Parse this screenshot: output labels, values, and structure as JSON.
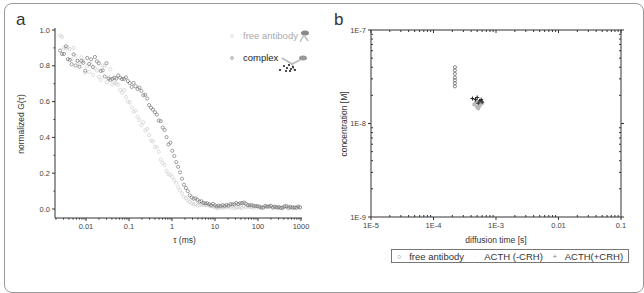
{
  "figure": {
    "panel_a_label": "a",
    "panel_b_label": "b"
  },
  "chart_data": [
    {
      "panel": "a",
      "type": "scatter",
      "title": "",
      "xlabel": "τ (ms)",
      "ylabel": "normalized G(τ)",
      "xscale": "log",
      "xlim": [
        0.002,
        1000
      ],
      "ylim": [
        -0.05,
        1.0
      ],
      "xticks": [
        "0.01",
        "0.1",
        "1",
        "10",
        "100",
        "1000"
      ],
      "yticks": [
        "0.0",
        "0.2",
        "0.4",
        "0.6",
        "0.8",
        "1.0"
      ],
      "legend": [
        "free antibody",
        "complex"
      ],
      "legend_position": "upper right",
      "series": [
        {
          "name": "free antibody",
          "marker": "open circle (light gray)",
          "color": "#c8c8c8",
          "x": [
            0.0025,
            0.004,
            0.006,
            0.01,
            0.02,
            0.04,
            0.07,
            0.1,
            0.2,
            0.3,
            0.5,
            0.7,
            1.0,
            1.5,
            2.0,
            3.0,
            5,
            10,
            30,
            100,
            1000
          ],
          "y": [
            0.97,
            0.9,
            0.84,
            0.8,
            0.77,
            0.73,
            0.66,
            0.6,
            0.48,
            0.41,
            0.31,
            0.24,
            0.18,
            0.11,
            0.06,
            0.03,
            0.02,
            0.01,
            0.01,
            0.01,
            0.01
          ]
        },
        {
          "name": "complex",
          "marker": "open circle (dark gray)",
          "color": "#666666",
          "x": [
            0.0025,
            0.004,
            0.006,
            0.01,
            0.02,
            0.04,
            0.07,
            0.1,
            0.2,
            0.3,
            0.5,
            0.7,
            1.0,
            1.5,
            2.0,
            3.0,
            5,
            10,
            20,
            40,
            100,
            1000
          ],
          "y": [
            0.9,
            0.87,
            0.84,
            0.82,
            0.8,
            0.76,
            0.73,
            0.71,
            0.65,
            0.58,
            0.49,
            0.42,
            0.33,
            0.21,
            0.12,
            0.06,
            0.04,
            0.02,
            0.02,
            0.035,
            0.015,
            0.01
          ]
        }
      ]
    },
    {
      "panel": "b",
      "type": "scatter",
      "title": "",
      "xlabel": "diffusion time [s]",
      "ylabel": "concentration [M]",
      "xscale": "log",
      "yscale": "log",
      "xlim": [
        1e-05,
        0.1
      ],
      "ylim": [
        1e-09,
        1e-07
      ],
      "xticks": [
        "1E-5",
        "1E-4",
        "1E-3",
        "0.01",
        "0.1"
      ],
      "yticks": [
        "1E-9",
        "1E-8",
        "1E-7"
      ],
      "legend": [
        "free antibody",
        "ACTH (-CRH)",
        "ACTH(+CRH)"
      ],
      "legend_position": "below plot",
      "series": [
        {
          "name": "free antibody",
          "marker": "open circle",
          "x": [
            0.00022,
            0.00022,
            0.00022,
            0.00022,
            0.00022,
            0.00022,
            0.00022
          ],
          "y": [
            4e-08,
            3.7e-08,
            3.4e-08,
            3.1e-08,
            2.9e-08,
            2.7e-08,
            2.5e-08
          ]
        },
        {
          "name": "ACTH (-CRH)",
          "marker": "light gray dot",
          "x": [
            0.00045,
            0.0005,
            0.00055,
            0.0006,
            0.00052,
            0.00048
          ],
          "y": [
            1.6e-08,
            1.5e-08,
            1.55e-08,
            1.65e-08,
            1.45e-08,
            1.7e-08
          ]
        },
        {
          "name": "ACTH(+CRH)",
          "marker": "plus",
          "x": [
            0.00042,
            0.00047,
            0.0005,
            0.00055,
            0.0006,
            0.00052,
            0.00058
          ],
          "y": [
            1.85e-08,
            1.8e-08,
            1.9e-08,
            1.75e-08,
            1.7e-08,
            1.65e-08,
            1.8e-08
          ]
        }
      ]
    }
  ],
  "legend_b": {
    "items": [
      {
        "symbol": "○",
        "label": "free antibody"
      },
      {
        "symbol": "·",
        "label": "ACTH (-CRH)"
      },
      {
        "symbol": "+",
        "label": "ACTH(+CRH)"
      }
    ]
  }
}
